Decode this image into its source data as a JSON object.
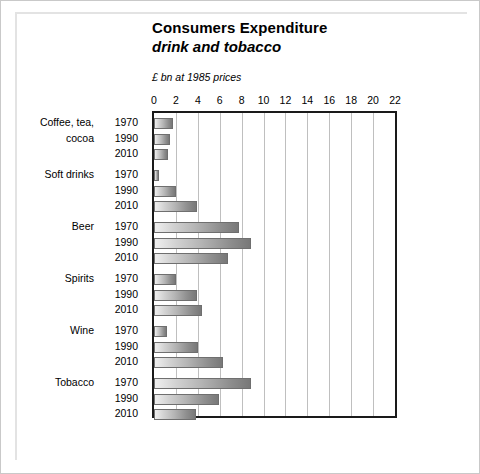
{
  "chart_data": {
    "type": "bar",
    "orientation": "horizontal",
    "title": "Consumers Expenditure",
    "subtitle": "drink and tobacco",
    "units_note": "£ bn at 1985 prices",
    "xlabel": "",
    "ylabel": "",
    "xlim": [
      0,
      22
    ],
    "xticks": [
      0,
      2,
      4,
      6,
      8,
      10,
      12,
      14,
      16,
      18,
      20,
      22
    ],
    "grid": true,
    "legend": "none",
    "years": [
      "1970",
      "1990",
      "2010"
    ],
    "categories": [
      "Coffee, tea, cocoa",
      "Soft drinks",
      "Beer",
      "Spirits",
      "Wine",
      "Tobacco"
    ],
    "category_lines": [
      [
        "Coffee, tea,",
        "cocoa"
      ],
      [
        "Soft drinks",
        ""
      ],
      [
        "Beer",
        ""
      ],
      [
        "Spirits",
        ""
      ],
      [
        "Wine",
        ""
      ],
      [
        "Tobacco",
        ""
      ]
    ],
    "groups": [
      {
        "category": "Coffee, tea, cocoa",
        "bars": [
          {
            "year": "1970",
            "value": 1.7
          },
          {
            "year": "1990",
            "value": 1.5
          },
          {
            "year": "2010",
            "value": 1.3
          }
        ]
      },
      {
        "category": "Soft drinks",
        "bars": [
          {
            "year": "1970",
            "value": 0.5
          },
          {
            "year": "1990",
            "value": 2.0
          },
          {
            "year": "2010",
            "value": 3.9
          }
        ]
      },
      {
        "category": "Beer",
        "bars": [
          {
            "year": "1970",
            "value": 7.8
          },
          {
            "year": "1990",
            "value": 8.9
          },
          {
            "year": "2010",
            "value": 6.8
          }
        ]
      },
      {
        "category": "Spirits",
        "bars": [
          {
            "year": "1970",
            "value": 2.0
          },
          {
            "year": "1990",
            "value": 3.9
          },
          {
            "year": "2010",
            "value": 4.4
          }
        ]
      },
      {
        "category": "Wine",
        "bars": [
          {
            "year": "1970",
            "value": 1.2
          },
          {
            "year": "1990",
            "value": 4.0
          },
          {
            "year": "2010",
            "value": 6.3
          }
        ]
      },
      {
        "category": "Tobacco",
        "bars": [
          {
            "year": "1970",
            "value": 8.9
          },
          {
            "year": "1990",
            "value": 5.9
          },
          {
            "year": "2010",
            "value": 3.8
          }
        ]
      }
    ],
    "colors": {
      "bar_light": "#efefef",
      "bar_dark": "#787878",
      "bar_border": "#6f6f6f",
      "axis": "#1a1a1a",
      "grid": "#bfbfbf",
      "frame": "#c9c9c9",
      "text": "#000000",
      "background": "#ffffff"
    }
  }
}
